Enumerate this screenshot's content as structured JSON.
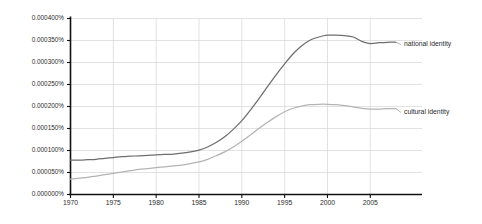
{
  "chart_data": {
    "type": "line",
    "title": "",
    "xlabel": "",
    "ylabel": "",
    "xlim": [
      1970,
      2008
    ],
    "ylim": [
      0.0,
      0.0004
    ],
    "grid": true,
    "legend_position": "right-inline-labels",
    "y_tick_labels": [
      "0.000400%",
      "0.000350%",
      "0.000300%",
      "0.000250%",
      "0.000200%",
      "0.000150%",
      "0.000100%",
      "0.000050%",
      "0.000000%"
    ],
    "y_tick_values": [
      0.0004,
      0.00035,
      0.0003,
      0.00025,
      0.0002,
      0.00015,
      0.0001,
      5e-05,
      0.0
    ],
    "x_tick_labels": [
      "1970",
      "1975",
      "1980",
      "1985",
      "1990",
      "1995",
      "2000",
      "2005"
    ],
    "x_tick_values": [
      1970,
      1975,
      1980,
      1985,
      1990,
      1995,
      2000,
      2005
    ],
    "x": [
      1970,
      1971,
      1972,
      1973,
      1974,
      1975,
      1976,
      1977,
      1978,
      1979,
      1980,
      1981,
      1982,
      1983,
      1984,
      1985,
      1986,
      1987,
      1988,
      1989,
      1990,
      1991,
      1992,
      1993,
      1994,
      1995,
      1996,
      1997,
      1998,
      1999,
      2000,
      2001,
      2002,
      2003,
      2004,
      2005,
      2006,
      2007,
      2008
    ],
    "series": [
      {
        "name": "national identity",
        "color": "#6e6e6e",
        "values": [
          7.8e-05,
          7.8e-05,
          7.9e-05,
          8e-05,
          8.2e-05,
          8.4e-05,
          8.6e-05,
          8.7e-05,
          8.8e-05,
          8.9e-05,
          9e-05,
          9.1e-05,
          9.2e-05,
          9.4e-05,
          9.7e-05,
          0.000101,
          0.000108,
          0.000118,
          0.000131,
          0.000148,
          0.000168,
          0.000192,
          0.000218,
          0.000245,
          0.000272,
          0.000297,
          0.00032,
          0.000338,
          0.000351,
          0.000358,
          0.000362,
          0.000362,
          0.000361,
          0.000358,
          0.000348,
          0.000343,
          0.000345,
          0.000346,
          0.000346
        ]
      },
      {
        "name": "cultural identity",
        "color": "#b4b4b4",
        "values": [
          3.5e-05,
          3.7e-05,
          3.9e-05,
          4.2e-05,
          4.5e-05,
          4.8e-05,
          5.1e-05,
          5.4e-05,
          5.7e-05,
          5.9e-05,
          6.1e-05,
          6.3e-05,
          6.5e-05,
          6.7e-05,
          7e-05,
          7.4e-05,
          8e-05,
          8.8e-05,
          9.7e-05,
          0.000108,
          0.000121,
          0.000135,
          0.00015,
          0.000164,
          0.000177,
          0.000188,
          0.000196,
          0.000201,
          0.000204,
          0.000205,
          0.000205,
          0.000204,
          0.000202,
          0.000199,
          0.000196,
          0.000194,
          0.000194,
          0.000195,
          0.000195
        ]
      }
    ]
  },
  "legend": {
    "entries": [
      {
        "label": "national identity"
      },
      {
        "label": "cultural identity"
      }
    ]
  },
  "colors": {
    "background": "#ffffff",
    "axis": "#111111",
    "grid": "#d5d5d5",
    "series_national": "#6e6e6e",
    "series_cultural": "#b4b4b4",
    "text": "#2b2b2b"
  }
}
